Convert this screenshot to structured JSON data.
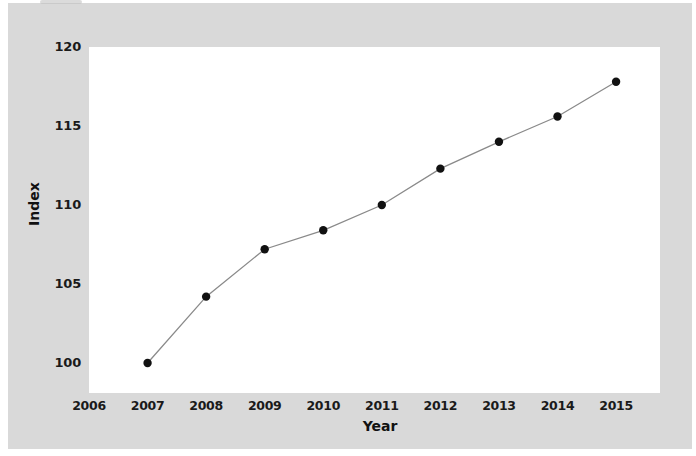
{
  "chart_data": {
    "type": "line",
    "title": "",
    "xlabel": "Year",
    "ylabel": "Index",
    "x": [
      2007,
      2008,
      2009,
      2010,
      2011,
      2012,
      2013,
      2014,
      2015
    ],
    "values": [
      100.0,
      104.2,
      107.2,
      108.4,
      110.0,
      112.3,
      114.0,
      115.6,
      117.8
    ],
    "series": [
      {
        "name": "Index",
        "values": [
          100.0,
          104.2,
          107.2,
          108.4,
          110.0,
          112.3,
          114.0,
          115.6,
          117.8
        ]
      }
    ],
    "xticks": [
      "2006",
      "2007",
      "2008",
      "2009",
      "2010",
      "2011",
      "2012",
      "2013",
      "2014",
      "2015"
    ],
    "xtick_values": [
      2006,
      2007,
      2008,
      2009,
      2010,
      2011,
      2012,
      2013,
      2014,
      2015
    ],
    "yticks": [
      "100",
      "105",
      "110",
      "115",
      "120"
    ],
    "ytick_values": [
      100,
      105,
      110,
      115,
      120
    ],
    "xlim": [
      2006,
      2015.75
    ],
    "ylim": [
      98.1,
      120.0
    ],
    "grid": false,
    "legend": null,
    "marker": "circle",
    "marker_color": "#111111",
    "line_color": "#8a8a8a",
    "plot_background": "#ffffff",
    "figure_background": "#d9d9d9"
  },
  "axes": {
    "y_title": "Index",
    "x_title": "Year"
  }
}
